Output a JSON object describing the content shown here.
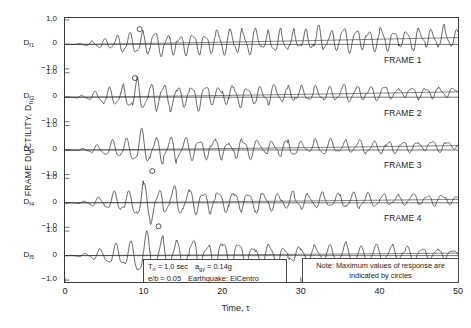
{
  "chart_data": {
    "type": "line",
    "title": "",
    "subtitle": "",
    "xlabel": "Time, τ",
    "ylabel": "FRAME DUCTILITY, D",
    "ylabel_sub": "fi",
    "xlim": [
      0,
      50
    ],
    "ylim": [
      -1.6,
      1.6
    ],
    "xticks": [
      "0",
      "10",
      "20",
      "30",
      "40",
      "50"
    ],
    "xtick_values": [
      0,
      10,
      20,
      30,
      40,
      50
    ],
    "yticks": [
      "1.0",
      "0",
      "−1.0"
    ],
    "ytick_values": [
      1.0,
      0,
      -1.0
    ],
    "grid": false,
    "legend": "none",
    "panel_count": 5,
    "panels": [
      {
        "id": "frame-1",
        "frame_label": "FRAME 1",
        "axis_label": "D",
        "axis_label_sub": "f1",
        "max_marker": {
          "x": 9.5,
          "y": 0.62
        },
        "envelope_peak_time": 9.5,
        "envelope_peak_value": 0.62,
        "decay_rate": 0.012,
        "period": 1.6,
        "phase": 0.6,
        "drift_end": 0.28,
        "series_description": "Decaying oscillatory frame ductility response, FRAME 1"
      },
      {
        "id": "frame-2",
        "frame_label": "FRAME 2",
        "axis_label": "D",
        "axis_label_sub": "f2",
        "max_marker": {
          "x": 8.9,
          "y": 0.78
        },
        "envelope_peak_time": 8.9,
        "envelope_peak_value": 0.86,
        "decay_rate": 0.055,
        "period": 1.75,
        "phase": 0.2,
        "drift_end": 0.22,
        "series_description": "Decaying oscillatory frame ductility response, FRAME 2"
      },
      {
        "id": "frame-3",
        "frame_label": "FRAME 3",
        "axis_label": "D",
        "axis_label_sub": "f3",
        "max_marker": {
          "x": 11.1,
          "y": -0.86
        },
        "envelope_peak_time": 10.2,
        "envelope_peak_value": 0.84,
        "decay_rate": 0.062,
        "period": 1.85,
        "phase": 0.0,
        "drift_end": 0.18,
        "series_description": "Decaying oscillatory frame ductility response, FRAME 3"
      },
      {
        "id": "frame-4",
        "frame_label": "FRAME 4",
        "axis_label": "D",
        "axis_label_sub": "f4",
        "max_marker": {
          "x": 11.9,
          "y": -0.96
        },
        "envelope_peak_time": 10.6,
        "envelope_peak_value": 0.95,
        "decay_rate": 0.07,
        "period": 1.9,
        "phase": -0.2,
        "drift_end": 0.14,
        "series_description": "Decaying oscillatory frame ductility response, FRAME 4"
      },
      {
        "id": "frame-5",
        "frame_label": "FRAME 5",
        "axis_label": "D",
        "axis_label_sub": "f5",
        "max_marker": {
          "x": 12.4,
          "y": -1.22
        },
        "envelope_peak_time": 11.0,
        "envelope_peak_value": 1.2,
        "decay_rate": 0.078,
        "period": 1.95,
        "phase": -0.35,
        "drift_end": 0.1,
        "series_description": "Decaying oscillatory frame ductility response, FRAME 5"
      }
    ],
    "marker_style": "open-circle",
    "line_color": "#2b2b2b",
    "axis_color": "#3a3a3a"
  },
  "annotations": {
    "params": {
      "period_label": "T",
      "period_sub": "n",
      "period_value": "= 1.0 sec",
      "accel_label": "a",
      "accel_sub": "gy",
      "accel_value": "= 0.14g",
      "eccentricity": "e/b = 0.05",
      "earthquake": "Earthquake: ElCentro"
    },
    "note": {
      "line1": "Note: Maximum values of response are",
      "line2": "indicated by circles"
    }
  }
}
